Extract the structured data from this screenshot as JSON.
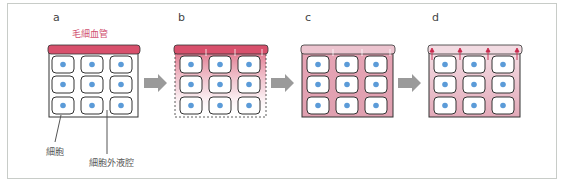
{
  "panels": [
    {
      "id": "a",
      "label": "a"
    },
    {
      "id": "b",
      "label": "b"
    },
    {
      "id": "c",
      "label": "c"
    },
    {
      "id": "d",
      "label": "d"
    }
  ],
  "labels": {
    "capillary": "毛細血管",
    "cell": "細胞",
    "extracellular_space": "細胞外液腔"
  },
  "colors": {
    "capillary_red": "#d8506c",
    "capillary_pale": "#ecc4cf",
    "fluid_pink": "#e6aebd",
    "nucleus_blue": "#5b9bd8",
    "arrow_gray": "#9a9a9a",
    "frame": "#c8ccc8"
  }
}
